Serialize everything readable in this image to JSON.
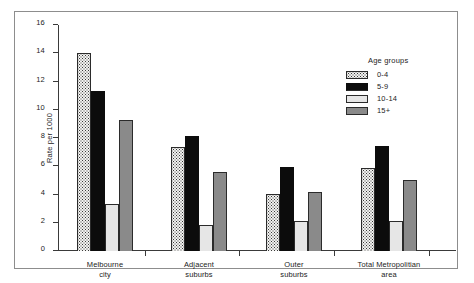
{
  "chart_data": {
    "type": "bar",
    "title": "",
    "xlabel": "",
    "ylabel": "Rate per 1000",
    "ylim": [
      0,
      16
    ],
    "yticks": [
      "0",
      "2",
      "4",
      "6",
      "8",
      "10",
      "12",
      "14",
      "16"
    ],
    "grid": false,
    "legend_position": "top-right",
    "legend_title": "Age groups",
    "categories": [
      "Melbourne\ncity",
      "Adjacent\nsuburbs",
      "Outer\nsuburbs",
      "Total Metropolitian\narea"
    ],
    "category_lines": [
      [
        "Melbourne",
        "city"
      ],
      [
        "Adjacent",
        "suburbs"
      ],
      [
        "Outer",
        "suburbs"
      ],
      [
        "Total Metropolitian",
        "area"
      ]
    ],
    "series": [
      {
        "name": "0-4",
        "values": [
          14.0,
          7.35,
          4.05,
          5.85
        ],
        "fill": "stipple",
        "color": "#f2f2f0"
      },
      {
        "name": "5-9",
        "values": [
          11.3,
          8.15,
          5.95,
          7.4
        ],
        "fill": "solid-black",
        "color": "#0c0c0c"
      },
      {
        "name": "10-14",
        "values": [
          3.3,
          1.85,
          2.1,
          2.1
        ],
        "fill": "solid-light",
        "color": "#e6e6e6"
      },
      {
        "name": "15+",
        "values": [
          9.3,
          5.6,
          4.2,
          5.0
        ],
        "fill": "solid-gray",
        "color": "#8a8a8a"
      }
    ]
  },
  "axis_colors": {
    "axis_line": "#3a3a3a",
    "text": "#232323",
    "frame": "#8d8d8d"
  }
}
